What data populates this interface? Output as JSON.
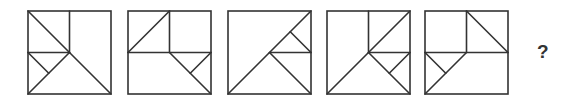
{
  "puzzle": {
    "stroke_color": "#333333",
    "stroke_width": 1.6,
    "square_size": 83,
    "top": 11,
    "question_mark": "?",
    "panels": [
      {
        "x": 28,
        "lines": [
          [
            0,
            0,
            0.5,
            0.5
          ],
          [
            0.5,
            0,
            0.5,
            0.5
          ],
          [
            0,
            0.5,
            0.5,
            0.5
          ],
          [
            0,
            0.5,
            0.25,
            0.75
          ],
          [
            0,
            1,
            0.5,
            0.5
          ],
          [
            0.5,
            0.5,
            1,
            1
          ]
        ]
      },
      {
        "x": 128,
        "lines": [
          [
            0,
            0.5,
            0.5,
            0
          ],
          [
            0.5,
            0,
            0.5,
            0.5
          ],
          [
            0,
            0.5,
            1,
            0.5
          ],
          [
            0.5,
            0.5,
            1,
            1
          ],
          [
            1,
            0.5,
            0.75,
            0.75
          ]
        ]
      },
      {
        "x": 228,
        "lines": [
          [
            0,
            1,
            1,
            0
          ],
          [
            0.5,
            0.5,
            1,
            0.5
          ],
          [
            0.75,
            0.25,
            1,
            0.5
          ],
          [
            0.5,
            0.5,
            1,
            1
          ]
        ]
      },
      {
        "x": 327,
        "lines": [
          [
            0.5,
            0,
            0.5,
            0.5
          ],
          [
            0,
            1,
            1,
            0
          ],
          [
            0.5,
            0.5,
            1,
            0.5
          ],
          [
            0.5,
            0.5,
            1,
            1
          ],
          [
            1,
            0.5,
            0.75,
            0.75
          ]
        ]
      },
      {
        "x": 425,
        "lines": [
          [
            0.5,
            0,
            0.5,
            0.5
          ],
          [
            0.5,
            0,
            1,
            0.5
          ],
          [
            0,
            0.5,
            1,
            0.5
          ],
          [
            0,
            0.5,
            0.25,
            0.75
          ],
          [
            0,
            1,
            0.5,
            0.5
          ]
        ]
      }
    ]
  }
}
